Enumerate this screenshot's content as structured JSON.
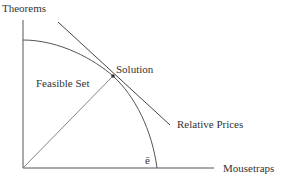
{
  "diagram": {
    "y_axis_label": "Theorems",
    "x_axis_label": "Mousetraps",
    "region_label": "Feasible Set",
    "point_label": "Solution",
    "line_label": "Relative Prices",
    "intercept_label": "ē",
    "colors": {
      "stroke": "#555555",
      "text": "#333333",
      "background": "#ffffff"
    }
  }
}
